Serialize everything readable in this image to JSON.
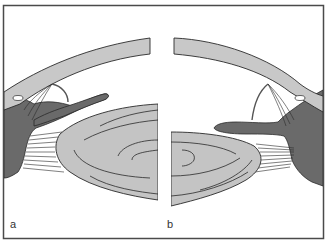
{
  "figure": {
    "panels": [
      {
        "id": "a",
        "label": "a"
      },
      {
        "id": "b",
        "label": "b"
      }
    ],
    "colors": {
      "background": "#ffffff",
      "frame": "#4a4a4a",
      "light_tissue": "#c8c8c8",
      "dark_tissue": "#6a6a6a",
      "lens_fill": "#c4c4c4",
      "line": "#2a2a2a"
    }
  }
}
